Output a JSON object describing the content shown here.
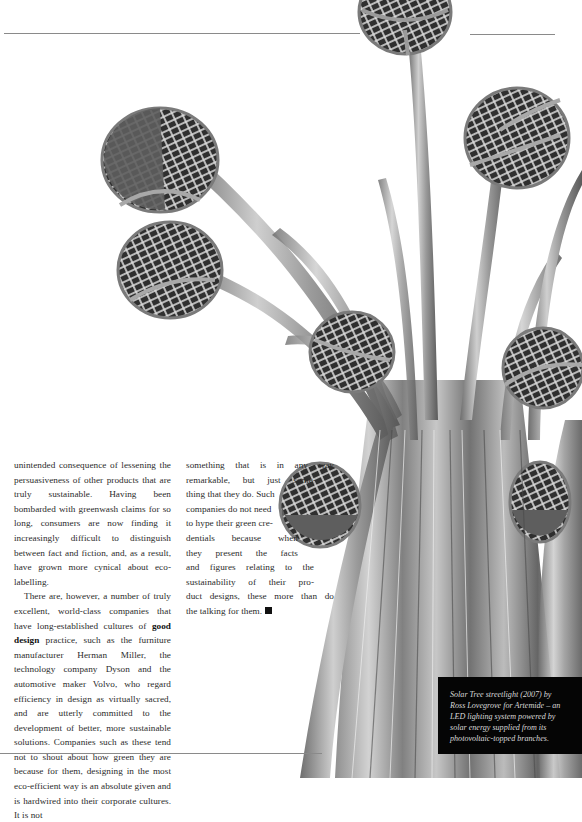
{
  "page": {
    "body_column_1": {
      "paragraph_1": "unintended consequence of lessening the persuasiveness of other products that are truly sustainable. Having been bombarded with greenwash claims for so long, consumers are now finding it increasingly difficult to distinguish between fact and fiction, and, as a result, have grown more cynical about eco-labelling.",
      "paragraph_2_before_bold": "There are, however, a number of truly excellent, world-class companies that have long-established cultures of ",
      "paragraph_2_bold": "good design",
      "paragraph_2_after_bold": " practice, such as the furniture manufacturer Herman Miller, the technology company Dyson and the automotive maker Volvo, who regard efficiency in design as virtually sacred, and are utterly committed to the development of better, more sustainable solutions. Companies such as these tend not to shout about how green they are because for them, designing in the most eco-efficient way is an absolute given and is hardwired into their corporate cultures. It is not"
    },
    "body_column_2": {
      "lines": [
        "something that is in any way",
        "remarkable, but just some-",
        "thing that they do. Such",
        "companies do not need",
        "to hype their green cre-",
        "dentials because when",
        "they present the facts",
        "and figures relating to the",
        "sustainability of their pro-",
        "duct designs, these more than do",
        "the talking for them."
      ],
      "end_mark": "end-of-article-square"
    },
    "photo": {
      "subject": "Solar Tree streetlight with photovoltaic disc-topped branches",
      "description": "black-and-white photograph of curved steel stems fanning out to circular solar panels"
    },
    "caption": {
      "lines": [
        "Solar Tree streetlight (2007) by",
        "Ross Lovegrove for Artemide – an",
        "LED lighting system powered by",
        "solar energy supplied from its",
        "photovoltaic-topped branches."
      ]
    },
    "colors": {
      "page_background": "#ffffff",
      "body_text": "#2b2b2b",
      "rule": "#8a8a8a",
      "caption_background": "#050505",
      "caption_text": "#d8d8d8"
    }
  }
}
